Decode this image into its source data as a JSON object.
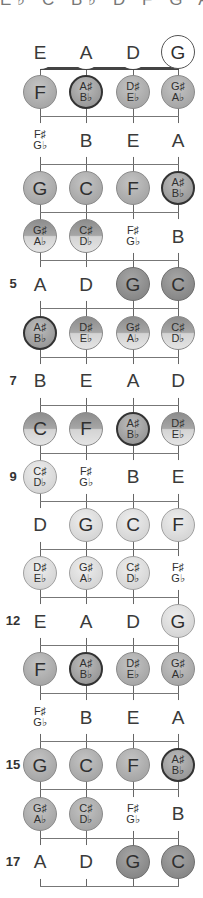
{
  "header": {
    "clipped_scale_text": "E♭ C B♭ D F G A"
  },
  "strings": [
    "E",
    "A",
    "D",
    "G"
  ],
  "open_strings": [
    {
      "label": "E",
      "style": "plain"
    },
    {
      "label": "A",
      "style": "plain"
    },
    {
      "label": "D",
      "style": "plain"
    },
    {
      "label": "G",
      "style": "open"
    }
  ],
  "fret_markers": {
    "5": "5",
    "7": "7",
    "9": "9",
    "12": "12",
    "15": "15",
    "17": "17"
  },
  "colors": {
    "string_line": "#666666",
    "fret_line": "#777777",
    "nut": "#444444",
    "root_border": "#333333"
  },
  "frets": [
    {
      "fret": 1,
      "notes": [
        {
          "l1": "F",
          "style": "mid"
        },
        {
          "l1": "A♯",
          "l2": "B♭",
          "style": "root"
        },
        {
          "l1": "D♯",
          "l2": "E♭",
          "style": "mid"
        },
        {
          "l1": "G♯",
          "l2": "A♭",
          "style": "mid"
        }
      ]
    },
    {
      "fret": 2,
      "notes": [
        {
          "l1": "F♯",
          "l2": "G♭",
          "style": "plain"
        },
        {
          "l1": "B",
          "style": "plain"
        },
        {
          "l1": "E",
          "style": "plain"
        },
        {
          "l1": "A",
          "style": "plain"
        }
      ]
    },
    {
      "fret": 3,
      "notes": [
        {
          "l1": "G",
          "style": "mid"
        },
        {
          "l1": "C",
          "style": "mid"
        },
        {
          "l1": "F",
          "style": "mid"
        },
        {
          "l1": "A♯",
          "l2": "B♭",
          "style": "root"
        }
      ]
    },
    {
      "fret": 4,
      "notes": [
        {
          "l1": "G♯",
          "l2": "A♭",
          "style": "split"
        },
        {
          "l1": "C♯",
          "l2": "D♭",
          "style": "split"
        },
        {
          "l1": "F♯",
          "l2": "G♭",
          "style": "plain"
        },
        {
          "l1": "B",
          "style": "plain"
        }
      ]
    },
    {
      "fret": 5,
      "notes": [
        {
          "l1": "A",
          "style": "plain"
        },
        {
          "l1": "D",
          "style": "plain"
        },
        {
          "l1": "G",
          "style": "dark"
        },
        {
          "l1": "C",
          "style": "dark"
        }
      ]
    },
    {
      "fret": 6,
      "notes": [
        {
          "l1": "A♯",
          "l2": "B♭",
          "style": "root"
        },
        {
          "l1": "D♯",
          "l2": "E♭",
          "style": "split"
        },
        {
          "l1": "G♯",
          "l2": "A♭",
          "style": "split"
        },
        {
          "l1": "C♯",
          "l2": "D♭",
          "style": "split"
        }
      ]
    },
    {
      "fret": 7,
      "notes": [
        {
          "l1": "B",
          "style": "plain"
        },
        {
          "l1": "E",
          "style": "plain"
        },
        {
          "l1": "A",
          "style": "plain"
        },
        {
          "l1": "D",
          "style": "plain"
        }
      ]
    },
    {
      "fret": 8,
      "notes": [
        {
          "l1": "C",
          "style": "split"
        },
        {
          "l1": "F",
          "style": "split"
        },
        {
          "l1": "A♯",
          "l2": "B♭",
          "style": "root"
        },
        {
          "l1": "D♯",
          "l2": "E♭",
          "style": "split"
        }
      ]
    },
    {
      "fret": 9,
      "notes": [
        {
          "l1": "C♯",
          "l2": "D♭",
          "style": "light"
        },
        {
          "l1": "F♯",
          "l2": "G♭",
          "style": "plain"
        },
        {
          "l1": "B",
          "style": "plain"
        },
        {
          "l1": "E",
          "style": "plain"
        }
      ]
    },
    {
      "fret": 10,
      "notes": [
        {
          "l1": "D",
          "style": "plain"
        },
        {
          "l1": "G",
          "style": "light"
        },
        {
          "l1": "C",
          "style": "light"
        },
        {
          "l1": "F",
          "style": "light"
        }
      ]
    },
    {
      "fret": 11,
      "notes": [
        {
          "l1": "D♯",
          "l2": "E♭",
          "style": "light"
        },
        {
          "l1": "G♯",
          "l2": "A♭",
          "style": "light"
        },
        {
          "l1": "C♯",
          "l2": "D♭",
          "style": "light"
        },
        {
          "l1": "F♯",
          "l2": "G♭",
          "style": "plain"
        }
      ]
    },
    {
      "fret": 12,
      "notes": [
        {
          "l1": "E",
          "style": "plain"
        },
        {
          "l1": "A",
          "style": "plain"
        },
        {
          "l1": "D",
          "style": "plain"
        },
        {
          "l1": "G",
          "style": "light"
        }
      ]
    },
    {
      "fret": 13,
      "notes": [
        {
          "l1": "F",
          "style": "mid"
        },
        {
          "l1": "A♯",
          "l2": "B♭",
          "style": "root"
        },
        {
          "l1": "D♯",
          "l2": "E♭",
          "style": "mid"
        },
        {
          "l1": "G♯",
          "l2": "A♭",
          "style": "mid"
        }
      ]
    },
    {
      "fret": 14,
      "notes": [
        {
          "l1": "F♯",
          "l2": "G♭",
          "style": "plain"
        },
        {
          "l1": "B",
          "style": "plain"
        },
        {
          "l1": "E",
          "style": "plain"
        },
        {
          "l1": "A",
          "style": "plain"
        }
      ]
    },
    {
      "fret": 15,
      "notes": [
        {
          "l1": "G",
          "style": "mid"
        },
        {
          "l1": "C",
          "style": "mid"
        },
        {
          "l1": "F",
          "style": "mid"
        },
        {
          "l1": "A♯",
          "l2": "B♭",
          "style": "root"
        }
      ]
    },
    {
      "fret": 16,
      "notes": [
        {
          "l1": "G♯",
          "l2": "A♭",
          "style": "mid"
        },
        {
          "l1": "C♯",
          "l2": "D♭",
          "style": "mid"
        },
        {
          "l1": "F♯",
          "l2": "G♭",
          "style": "plain"
        },
        {
          "l1": "B",
          "style": "plain"
        }
      ]
    },
    {
      "fret": 17,
      "notes": [
        {
          "l1": "A",
          "style": "plain"
        },
        {
          "l1": "D",
          "style": "plain"
        },
        {
          "l1": "G",
          "style": "dark"
        },
        {
          "l1": "C",
          "style": "dark"
        }
      ]
    }
  ]
}
